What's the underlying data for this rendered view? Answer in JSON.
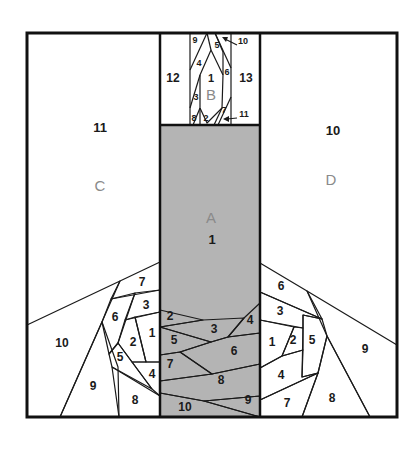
{
  "diagram": {
    "colors": {
      "white": "#ffffff",
      "light": "#e6e6e6",
      "mid": "#cfcfcf",
      "dark": "#b8b8b8",
      "centerA": "#b4b4b4",
      "line": "#1a1a1a",
      "section_letter": "#8a8a8a"
    },
    "sections": {
      "A": {
        "letter": "A",
        "center_label": "1",
        "bottom_labels": [
          "2",
          "3",
          "4",
          "5",
          "6",
          "7",
          "8",
          "9",
          "10"
        ]
      },
      "B": {
        "letter": "B",
        "labels": [
          "1",
          "2",
          "3",
          "4",
          "5",
          "6",
          "7",
          "8",
          "9",
          "10",
          "11",
          "12",
          "13"
        ]
      },
      "C": {
        "letter": "C",
        "labels": [
          "1",
          "2",
          "3",
          "4",
          "5",
          "6",
          "7",
          "8",
          "9",
          "10",
          "11"
        ]
      },
      "D": {
        "letter": "D",
        "labels": [
          "1",
          "2",
          "3",
          "4",
          "5",
          "6",
          "7",
          "8",
          "9",
          "10"
        ]
      }
    },
    "labels": {
      "A_letter": "A",
      "A1": "1",
      "A2": "2",
      "A3": "3",
      "A4": "4",
      "A5": "5",
      "A6": "6",
      "A7": "7",
      "A8": "8",
      "A9": "9",
      "A10": "10",
      "B_letter": "B",
      "B1": "1",
      "B2": "2",
      "B3": "3",
      "B4": "4",
      "B5": "5",
      "B6": "6",
      "B7": "7",
      "B8": "8",
      "B9": "9",
      "B10": "10",
      "B11": "11",
      "B12": "12",
      "B13": "13",
      "C_letter": "C",
      "C1": "1",
      "C2": "2",
      "C3": "3",
      "C4": "4",
      "C5": "5",
      "C6": "6",
      "C7": "7",
      "C8": "8",
      "C9": "9",
      "C10": "10",
      "C11": "11",
      "D_letter": "D",
      "D1": "1",
      "D2": "2",
      "D3": "3",
      "D4": "4",
      "D5": "5",
      "D6": "6",
      "D7": "7",
      "D8": "8",
      "D9": "9",
      "D10": "10"
    }
  }
}
